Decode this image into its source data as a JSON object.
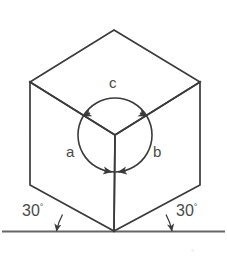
{
  "figure": {
    "kind": "isometric-cube-rotation-diagram",
    "background_color": "#ffffff",
    "line_color": "#3b3b3b",
    "text_color": "#4a4a4a",
    "baseline": {
      "name": "ground-line",
      "color": "#555555",
      "y": 231,
      "x_start": 2,
      "x_end": 225
    },
    "cube": {
      "stroke": "#3b3b3b",
      "stroke_width": 1.6,
      "vertices": {
        "top": [
          114,
          30
        ],
        "left_upper": [
          30,
          82
        ],
        "right_upper": [
          200,
          82
        ],
        "center": [
          115,
          135
        ],
        "left_lower": [
          30,
          185
        ],
        "right_lower": [
          200,
          185
        ],
        "bottom": [
          114,
          231
        ]
      }
    },
    "circle": {
      "name": "rotation-circle",
      "center": [
        115,
        135
      ],
      "radius": 37,
      "stroke": "#3b3b3b"
    },
    "arrows": [
      {
        "name": "arrow-c-to-a",
        "at_angle_deg": 210,
        "points": "counter-clockwise-to-left-edge"
      },
      {
        "name": "arrow-c-to-b",
        "at_angle_deg": 330,
        "points": "clockwise-to-right-edge"
      },
      {
        "name": "arrow-a-to-bottom",
        "at_angle_deg": 90,
        "points": "toward-bottom-left-of-vertical"
      },
      {
        "name": "arrow-b-to-bottom",
        "at_angle_deg": 90,
        "points": "toward-bottom-right-of-vertical"
      }
    ]
  },
  "labels": {
    "face_a": "a",
    "face_b": "b",
    "face_c": "c",
    "angle_left": "30",
    "angle_right": "30",
    "degree_symbol": "°"
  },
  "label_positions": {
    "face_a": [
      66,
      144
    ],
    "face_b": [
      153,
      144
    ],
    "face_c": [
      109,
      75
    ],
    "angle_left": [
      28,
      205
    ],
    "angle_right": [
      175,
      205
    ]
  },
  "angle_arcs": [
    {
      "name": "angle-arc-left",
      "vertex": [
        114,
        231
      ],
      "measure": "30",
      "arrowhead": "at-baseline-end"
    },
    {
      "name": "angle-arc-right",
      "vertex": [
        114,
        231
      ],
      "measure": "30",
      "arrowhead": "at-baseline-end"
    }
  ]
}
